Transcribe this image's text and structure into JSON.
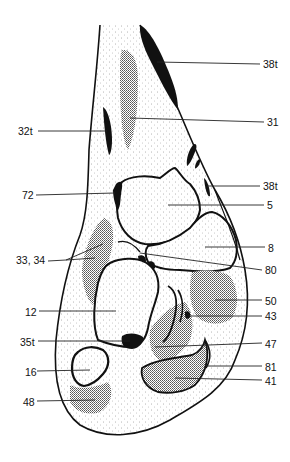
{
  "diagram": {
    "type": "anatomical cross-section",
    "labels": [
      {
        "id": "38t_top",
        "text": "38t",
        "side": "right",
        "x": 263,
        "y": 58,
        "target": [
          157,
          62
        ]
      },
      {
        "id": "31",
        "text": "31",
        "side": "right",
        "x": 267,
        "y": 116,
        "target": [
          130,
          118
        ]
      },
      {
        "id": "32t",
        "text": "32t",
        "side": "left",
        "x": 18,
        "y": 125,
        "target": [
          107,
          131
        ]
      },
      {
        "id": "38t_mid",
        "text": "38t",
        "side": "right",
        "x": 263,
        "y": 180,
        "target": [
          207,
          186
        ]
      },
      {
        "id": "72",
        "text": "72",
        "side": "left",
        "x": 22,
        "y": 189,
        "target": [
          115,
          193
        ]
      },
      {
        "id": "5",
        "text": "5",
        "side": "right",
        "x": 267,
        "y": 199,
        "target": [
          168,
          205
        ]
      },
      {
        "id": "8",
        "text": "8",
        "side": "right",
        "x": 268,
        "y": 242,
        "target": [
          205,
          247
        ]
      },
      {
        "id": "33_34",
        "text": "33, 34",
        "side": "left",
        "x": 16,
        "y": 254,
        "target": [
          66,
          260
        ]
      },
      {
        "id": "80",
        "text": "80",
        "side": "right",
        "x": 265,
        "y": 264,
        "target": [
          140,
          250
        ]
      },
      {
        "id": "50",
        "text": "50",
        "side": "right",
        "x": 265,
        "y": 295,
        "target": [
          215,
          300
        ]
      },
      {
        "id": "12",
        "text": "12",
        "side": "left",
        "x": 25,
        "y": 306,
        "target": [
          116,
          311
        ]
      },
      {
        "id": "43",
        "text": "43",
        "side": "right",
        "x": 265,
        "y": 310,
        "target": [
          188,
          316
        ]
      },
      {
        "id": "35t",
        "text": "35t",
        "side": "left",
        "x": 20,
        "y": 336,
        "target": [
          130,
          341
        ]
      },
      {
        "id": "47",
        "text": "47",
        "side": "right",
        "x": 265,
        "y": 338,
        "target": [
          155,
          347
        ]
      },
      {
        "id": "81",
        "text": "81",
        "side": "right",
        "x": 265,
        "y": 361,
        "target": [
          205,
          366
        ]
      },
      {
        "id": "16",
        "text": "16",
        "side": "left",
        "x": 25,
        "y": 366,
        "target": [
          90,
          370
        ]
      },
      {
        "id": "41",
        "text": "41",
        "side": "right",
        "x": 265,
        "y": 375,
        "target": [
          175,
          378
        ]
      },
      {
        "id": "48",
        "text": "48",
        "side": "left",
        "x": 23,
        "y": 396,
        "target": [
          95,
          400
        ]
      }
    ]
  },
  "colors": {
    "ink": "#111111",
    "stipple": "#9a9a9a",
    "background": "#ffffff"
  }
}
